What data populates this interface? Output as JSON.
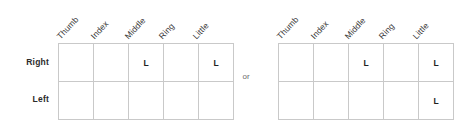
{
  "diagram": {
    "separator_label": "or",
    "column_headers": [
      "Thumb",
      "Index",
      "Middle",
      "Ring",
      "Little"
    ],
    "row_labels": [
      "Right",
      "Left"
    ],
    "mark_symbol": "L",
    "colors": {
      "grid_line": "#c9c9c9",
      "mark_text": "#1f1f1f",
      "row_label_text": "#2b2b2b",
      "column_header_text": "#3a3a3a",
      "separator_text": "#6b6b6b",
      "background": "#ffffff"
    },
    "tables": [
      {
        "name": "option-a",
        "rows": [
          {
            "label": "Right",
            "cells": [
              "",
              "",
              "L",
              "",
              "L"
            ]
          },
          {
            "label": "Left",
            "cells": [
              "",
              "",
              "",
              "",
              ""
            ]
          }
        ]
      },
      {
        "name": "option-b",
        "rows": [
          {
            "label": "Right",
            "cells": [
              "",
              "",
              "L",
              "",
              "L"
            ]
          },
          {
            "label": "Left",
            "cells": [
              "",
              "",
              "",
              "",
              "L"
            ]
          }
        ]
      }
    ]
  }
}
